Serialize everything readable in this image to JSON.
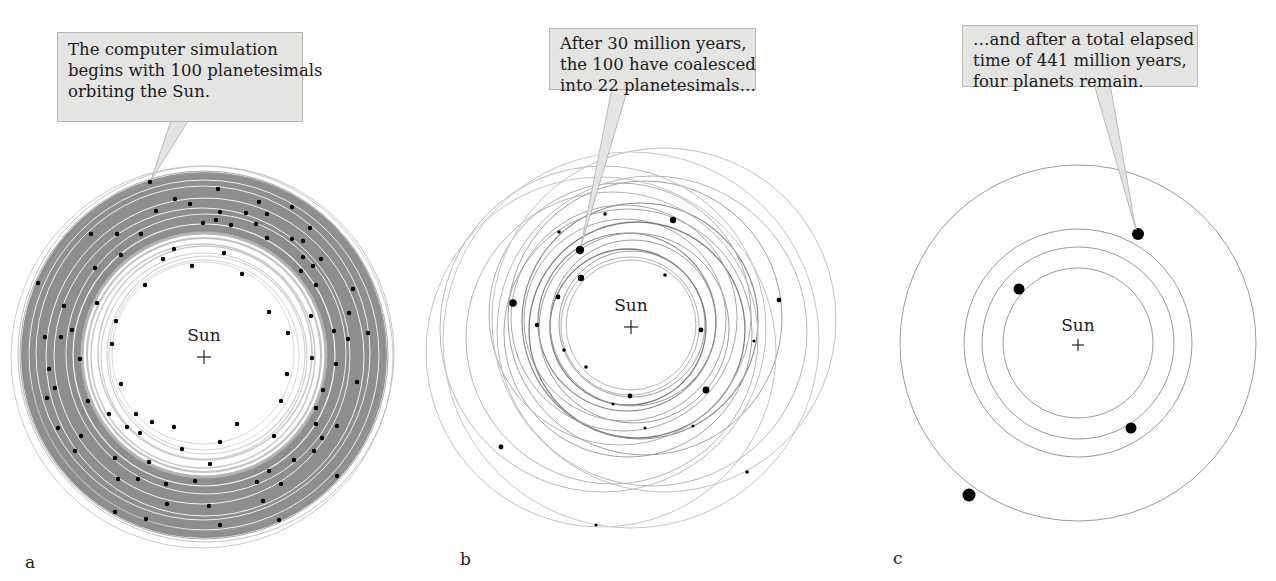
{
  "figure": {
    "panels": [
      {
        "id": "a",
        "label": "a",
        "callout": [
          "The computer simulation",
          "begins with 100 planetesimals",
          "orbiting the Sun."
        ],
        "sun_label": "Sun",
        "planetesimal_count": 100
      },
      {
        "id": "b",
        "label": "b",
        "callout": [
          "After 30 million years,",
          "the 100 have coalesced",
          "into 22 planetesimals…"
        ],
        "sun_label": "Sun",
        "planetesimal_count": 22,
        "elapsed_million_years": 30
      },
      {
        "id": "c",
        "label": "c",
        "callout": [
          "…and after a total elapsed",
          "time of 441 million years,",
          "four planets remain."
        ],
        "sun_label": "Sun",
        "planet_count": 4,
        "elapsed_million_years": 441
      }
    ],
    "colors": {
      "callout_bg": "#e4e4e2",
      "orbit_dense": "#8f8f8f",
      "orbit_line": "#a8a8a8",
      "body": "#000000"
    }
  }
}
